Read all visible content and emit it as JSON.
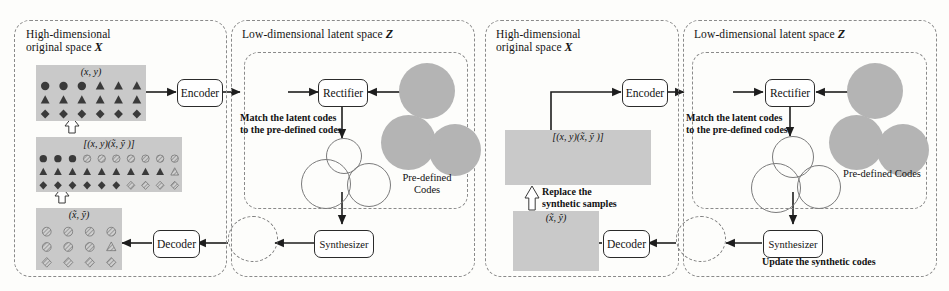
{
  "figure": {
    "type": "diagram",
    "domain": "method-pipeline",
    "halves": 2
  },
  "panels": [
    {
      "id": "left-x",
      "title_line1": "High-dimensional",
      "title_line2": "original space",
      "symbol": "X"
    },
    {
      "id": "left-z",
      "title_line1": "Low-dimensional latent space",
      "title_line2": "",
      "symbol": "Z"
    },
    {
      "id": "right-x",
      "title_line1": "High-dimensional",
      "title_line2": "original space",
      "symbol": "X"
    },
    {
      "id": "right-z",
      "title_line1": "Low-dimensional latent space",
      "title_line2": "",
      "symbol": "Z"
    }
  ],
  "nodes": {
    "encoder": "Encoder",
    "decoder": "Decoder",
    "rectifier": "Rectifier",
    "synthesizer": "Synthesizer"
  },
  "labels": {
    "match_line1": "Match the latent codes",
    "match_line2": "to the pre-defined codes",
    "predefined_line1": "Pre-defined",
    "predefined_line2": "Codes",
    "predefined_single": "Pre-defined Codes",
    "replace_line1": "Replace the",
    "replace_line2": "synthetic samples",
    "update": "Update the synthetic codes"
  },
  "grid_captions": {
    "real": "(x, y)",
    "mixed": "[(x, y)(x̃, ỹ )]",
    "synth": "(x̃, ỹ)"
  },
  "grids": {
    "left_real": {
      "cols": 6,
      "rows": 3,
      "cells": [
        [
          "circle",
          "circle",
          "circle",
          "triangle",
          "triangle",
          "triangle"
        ],
        [
          "triangle",
          "triangle",
          "triangle",
          "triangle",
          "triangle",
          "triangle"
        ],
        [
          "diamond",
          "diamond",
          "diamond",
          "diamond",
          "diamond",
          "diamond"
        ]
      ],
      "fill": [
        [
          "solid",
          "solid",
          "solid",
          "solid",
          "solid",
          "solid"
        ],
        [
          "solid",
          "solid",
          "solid",
          "solid",
          "solid",
          "solid"
        ],
        [
          "solid",
          "solid",
          "solid",
          "solid",
          "solid",
          "solid"
        ]
      ]
    },
    "left_mixed": {
      "cols": 10,
      "rows": 3,
      "cells": [
        [
          "circle",
          "circle",
          "circle",
          "circle",
          "circle",
          "circle",
          "circle",
          "circle",
          "circle",
          "circle"
        ],
        [
          "triangle",
          "triangle",
          "triangle",
          "triangle",
          "triangle",
          "triangle",
          "triangle",
          "triangle",
          "triangle",
          "triangle"
        ],
        [
          "diamond",
          "diamond",
          "diamond",
          "diamond",
          "diamond",
          "diamond",
          "diamond",
          "diamond",
          "diamond",
          "diamond"
        ]
      ],
      "fill": [
        [
          "solid",
          "solid",
          "solid",
          "hatch",
          "hatch",
          "hatch",
          "hatch",
          "hatch",
          "hatch",
          "hatch"
        ],
        [
          "solid",
          "solid",
          "solid",
          "solid",
          "solid",
          "solid",
          "solid",
          "solid",
          "solid",
          "hatch"
        ],
        [
          "solid",
          "solid",
          "solid",
          "solid",
          "solid",
          "solid",
          "hatch",
          "hatch",
          "hatch",
          "hatch"
        ]
      ]
    },
    "left_synth": {
      "cols": 4,
      "rows": 3,
      "cells": [
        [
          "circle",
          "circle",
          "circle",
          "circle"
        ],
        [
          "circle",
          "circle",
          "circle",
          "triangle"
        ],
        [
          "diamond",
          "diamond",
          "diamond",
          "diamond"
        ]
      ],
      "fill": [
        [
          "hatch",
          "hatch",
          "hatch",
          "hatch"
        ],
        [
          "hatch",
          "hatch",
          "hatch",
          "hatch"
        ],
        [
          "hatch",
          "hatch",
          "hatch",
          "hatch"
        ]
      ]
    }
  },
  "latent_clusters": {
    "encoded_blob_left": {
      "shapes": [
        "circle",
        "circle",
        "circle",
        "circle",
        "triangle",
        "triangle",
        "triangle",
        "triangle",
        "triangle",
        "circle",
        "triangle"
      ]
    },
    "encoded_blob_right": {
      "shapes": [
        "diamond",
        "diamond",
        "diamond",
        "diamond",
        "diamond"
      ]
    },
    "matched": [
      {
        "name": "circle-cluster",
        "shape": "circle",
        "count": 4
      },
      {
        "name": "triangle-cluster",
        "shape": "triangle",
        "count": 9
      },
      {
        "name": "diamond-cluster",
        "shape": "diamond",
        "count": 7
      }
    ],
    "predefined": [
      {
        "name": "circle-codes",
        "shape": "circle",
        "count": 9
      },
      {
        "name": "triangle-codes",
        "shape": "triangle",
        "count": 9
      },
      {
        "name": "diamond-codes",
        "shape": "diamond",
        "count": 9
      }
    ],
    "synthesized": {
      "shapes": [
        "circle",
        "circle",
        "circle",
        "circle",
        "circle",
        "circle",
        "circle"
      ],
      "stray": [
        "triangle",
        "diamond",
        "diamond",
        "diamond"
      ]
    }
  },
  "colors": {
    "grid_bg": "#c9c9c9",
    "blob_gray": "#b4b4b4",
    "shape_dark": "#3a3a3a",
    "shape_hatch": "#9a9a9a",
    "stroke": "#2b2b2b",
    "panel_border": "#8a8a8a",
    "page_bg": "#fdfdfb"
  }
}
